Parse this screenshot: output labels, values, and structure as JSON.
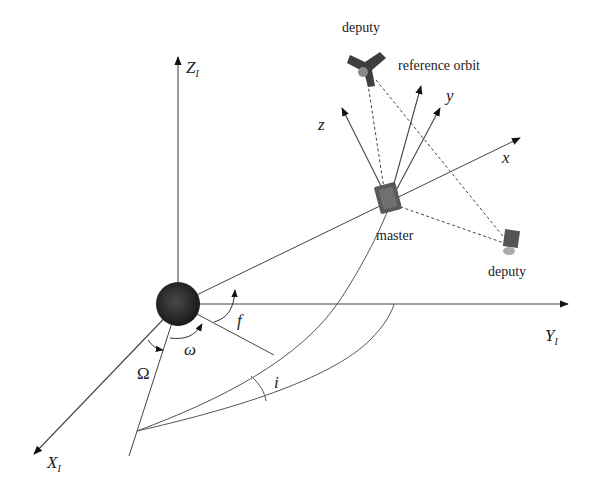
{
  "figure": {
    "type": "orbital-reference-frame-diagram",
    "background": "#ffffff",
    "line_color": "#333333",
    "earth_color": "#2a2a2a"
  },
  "inertial_axes": {
    "z": {
      "label": "Z",
      "subscript": "I"
    },
    "y": {
      "label": "Y",
      "subscript": "I"
    },
    "x": {
      "label": "X",
      "subscript": "I"
    }
  },
  "orbit_frame_axes": {
    "x": "x",
    "y": "y",
    "z": "z"
  },
  "angles": {
    "raan": "Ω",
    "arg_perigee": "ω",
    "true_anomaly": "f",
    "inclination": "i"
  },
  "satellites": {
    "master": "master",
    "deputy_top": "deputy",
    "deputy_right": "deputy",
    "reference_orbit": "reference orbit",
    "master_origin_marker": "o"
  }
}
